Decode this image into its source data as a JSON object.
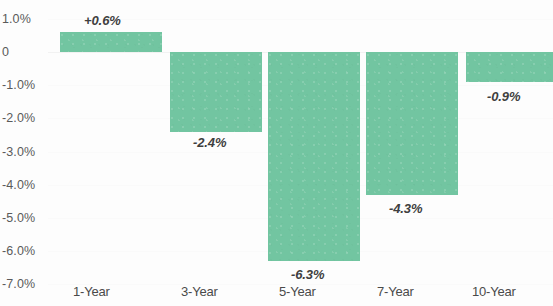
{
  "chart_data": {
    "type": "bar",
    "title": "",
    "subtitle": "",
    "xlabel": "",
    "ylabel": "",
    "categories": [
      "1-Year",
      "3-Year",
      "5-Year",
      "7-Year",
      "10-Year"
    ],
    "values": [
      0.6,
      -2.4,
      -6.3,
      -4.3,
      -0.9
    ],
    "data_labels": [
      "+0.6%",
      "-2.4%",
      "-6.3%",
      "-4.3%",
      "-0.9%"
    ],
    "ylim": [
      -7.0,
      1.0
    ],
    "ytick_values": [
      1.0,
      0,
      -1.0,
      -2.0,
      -3.0,
      -4.0,
      -5.0,
      -6.0,
      -7.0
    ],
    "ytick_labels": [
      "1.0%",
      "0",
      "-1.0%",
      "-2.0%",
      "-3.0%",
      "-4.0%",
      "-5.0%",
      "-6.0%",
      "-7.0%"
    ],
    "grid": true,
    "legend": "none",
    "series": [
      {
        "name": "",
        "values": [
          0.6,
          -2.4,
          -6.3,
          -4.3,
          -0.9
        ]
      }
    ],
    "colors": {
      "bar": "#72c5a1",
      "label_text": "#3f3f3f",
      "axis_text": "#5a5a5a",
      "background": "#fdfdfd",
      "gridline": "#fafafa"
    }
  },
  "layout": {
    "zero_y": 52,
    "px_per_percent": 33.2,
    "bars": [
      {
        "x": 60,
        "w": 102
      },
      {
        "x": 170,
        "w": 92
      },
      {
        "x": 268,
        "w": 92
      },
      {
        "x": 366,
        "w": 92
      },
      {
        "x": 466,
        "w": 87
      }
    ],
    "label_positions": [
      {
        "x": 84,
        "y": 14
      },
      {
        "x": 193,
        "y": 136
      },
      {
        "x": 291,
        "y": 268
      },
      {
        "x": 389,
        "y": 202
      },
      {
        "x": 487,
        "y": 90
      }
    ],
    "xtick_positions": [
      73,
      181,
      279,
      377,
      472
    ]
  }
}
